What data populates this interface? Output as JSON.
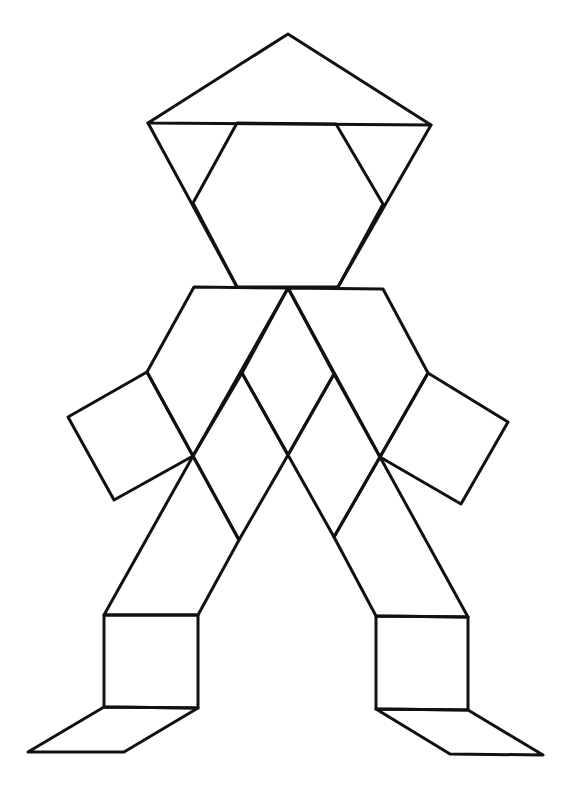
{
  "figure": {
    "stroke_color": "#111111",
    "background_color": "#ffffff",
    "parts": {
      "head": {
        "star_top_triangle": "288,34 148,123 431,125",
        "hexagon": "237,123 336,124 383,204 338,287 237,287 193,203",
        "star_bottom_triangle_left_side": "148,123 237,287",
        "star_bottom_triangle_right_side": "431,125 338,287"
      },
      "torso": {
        "left_trapezoid_arm": "194,287 288,288 193,456 147,372",
        "right_trapezoid_arm": "288,288 383,289 428,373 380,457",
        "center_rhombus_top": "288,288 334,374 288,455 242,373",
        "left_rhombus": "242,373 288,455 239,540 193,456",
        "right_rhombus": "334,374 380,457 334,537 288,455"
      },
      "arms": {
        "left_hand_square": "147,372 68,417 114,500 193,456",
        "right_hand_square": "428,373 508,422 461,504 380,457"
      },
      "legs": {
        "left_leg_rhombus": "193,456 239,540 198,615 104,615",
        "right_leg_rhombus": "380,457 468,617 376,616 334,537",
        "left_shin_square": "104,615 198,615 198,708 104,707",
        "right_shin_square": "376,616 468,617 468,710 376,709",
        "left_foot_rhombus": "104,707 198,708 124,752 28,752",
        "right_foot_rhombus": "376,709 468,710 543,755 450,754"
      }
    }
  }
}
